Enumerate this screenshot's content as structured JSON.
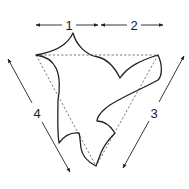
{
  "diagram": {
    "type": "folded-shape-measurement",
    "labels": {
      "m1": "1",
      "m2": "2",
      "m3": "3",
      "m4": "4"
    },
    "colors": {
      "stroke": "#222222",
      "dashed": "#555555",
      "background": "#ffffff"
    }
  }
}
